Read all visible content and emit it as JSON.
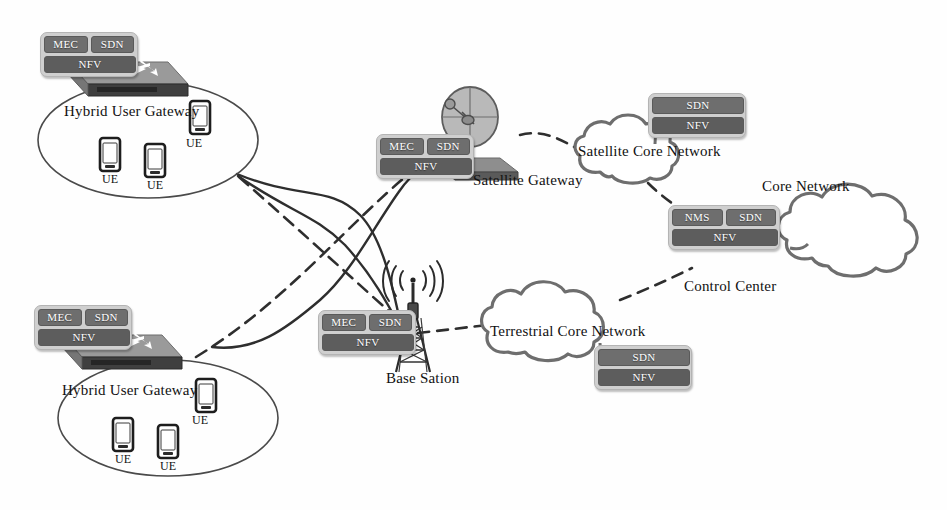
{
  "diagram": {
    "colors": {
      "box_fill": "#6e6e6e",
      "box_shell": "#cfcfcf",
      "line": "#333333",
      "cloud_stroke": "#6b6b6b",
      "ellipse_stroke": "#555555",
      "text": "#111111"
    }
  },
  "nodes": {
    "hybrid_gateway_top": {
      "label": "Hybrid User Gateway",
      "functions": [
        "MEC",
        "SDN",
        "NFV"
      ],
      "icon": "router-icon",
      "ues": [
        {
          "label": "UE"
        },
        {
          "label": "UE"
        },
        {
          "label": "UE"
        }
      ]
    },
    "hybrid_gateway_bottom": {
      "label": "Hybrid User Gateway",
      "functions": [
        "MEC",
        "SDN",
        "NFV"
      ],
      "icon": "router-icon",
      "ues": [
        {
          "label": "UE"
        },
        {
          "label": "UE"
        },
        {
          "label": "UE"
        }
      ]
    },
    "satellite_gateway": {
      "label": "Satellite Gateway",
      "functions": [
        "MEC",
        "SDN",
        "NFV"
      ],
      "icon": "satellite-dish-icon"
    },
    "base_station": {
      "label": "Base Sation",
      "functions": [
        "MEC",
        "SDN",
        "NFV"
      ],
      "icon": "antenna-tower-icon",
      "signal": "((( )))"
    },
    "satellite_core_network": {
      "label": "Satellite Core Network",
      "functions": [
        "SDN",
        "NFV"
      ],
      "icon": "cloud-icon"
    },
    "terrestrial_core_network": {
      "label": "Terrestrial Core Network",
      "functions": [
        "SDN",
        "NFV"
      ],
      "icon": "cloud-icon"
    },
    "core_network": {
      "label": "Core Network",
      "icon": "cloud-icon"
    },
    "control_center": {
      "label": "Control Center",
      "functions": [
        "NMS",
        "SDN",
        "NFV"
      ],
      "icon": "control-box-icon"
    }
  },
  "links": [
    {
      "from": "hybrid_gateway_top",
      "to": "base_station",
      "style": "solid"
    },
    {
      "from": "hybrid_gateway_top",
      "to": "satellite_gateway",
      "style": "dashed"
    },
    {
      "from": "hybrid_gateway_bottom",
      "to": "satellite_gateway",
      "style": "solid"
    },
    {
      "from": "hybrid_gateway_bottom",
      "to": "base_station",
      "style": "dashed"
    },
    {
      "from": "satellite_gateway",
      "to": "satellite_core_network",
      "style": "dashed"
    },
    {
      "from": "base_station",
      "to": "terrestrial_core_network",
      "style": "dashed"
    },
    {
      "from": "satellite_core_network",
      "to": "control_center",
      "style": "dashed"
    },
    {
      "from": "terrestrial_core_network",
      "to": "control_center",
      "style": "dashed"
    },
    {
      "from": "control_center",
      "to": "core_network",
      "style": "solid"
    }
  ]
}
